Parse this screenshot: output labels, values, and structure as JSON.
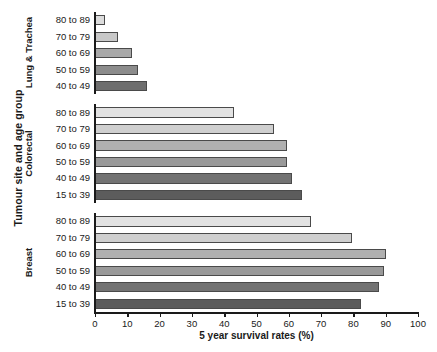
{
  "chart_data": {
    "type": "bar",
    "orientation": "horizontal",
    "title": "",
    "xlabel": "5 year survival rates (%)",
    "ylabel": "Tumour site and age group",
    "xlim": [
      0,
      100
    ],
    "xticks": [
      0,
      10,
      20,
      30,
      40,
      50,
      60,
      70,
      80,
      90,
      100
    ],
    "grid": false,
    "legend": "none",
    "groups": [
      {
        "name": "Lung & Trachea",
        "categories": [
          "80 to 89",
          "70 to 79",
          "60 to 69",
          "50 to 59",
          "40 to 49"
        ],
        "values": [
          3.2,
          7.0,
          11.5,
          13.2,
          16.2
        ],
        "colors": [
          "#dcdcdc",
          "#c8c8c8",
          "#a8a8a8",
          "#8c8c8c",
          "#6e6e6e"
        ]
      },
      {
        "name": "Colorectal",
        "categories": [
          "80 to 89",
          "70 to 79",
          "60 to 69",
          "50 to 59",
          "40 to 49",
          "15 to 39"
        ],
        "values": [
          43.0,
          55.5,
          59.5,
          59.5,
          61.0,
          64.0
        ],
        "colors": [
          "#e2e2e2",
          "#cfcfcf",
          "#b0b0b0",
          "#999999",
          "#737373",
          "#5c5c5c"
        ]
      },
      {
        "name": "Breast",
        "categories": [
          "80 to 89",
          "70 to 79",
          "60 to 69",
          "50 to 59",
          "40 to 49",
          "15 to 39"
        ],
        "values": [
          67.0,
          79.5,
          90.0,
          89.5,
          88.0,
          82.5
        ],
        "colors": [
          "#e2e2e2",
          "#cfcfcf",
          "#b0b0b0",
          "#999999",
          "#737373",
          "#5c5c5c"
        ]
      }
    ]
  },
  "axis": {
    "x_tick_labels": [
      "0",
      "10",
      "20",
      "30",
      "40",
      "50",
      "60",
      "70",
      "80",
      "90",
      "100"
    ],
    "x_title": "5 year survival rates (%)",
    "y_title": "Tumour site and age group"
  }
}
